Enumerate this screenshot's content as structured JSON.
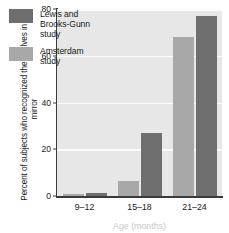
{
  "chart_data": {
    "type": "bar",
    "title": "",
    "xlabel": "Age (months)",
    "ylabel": "Percent of subjects who recognized themselves in a mirror",
    "categories": [
      "9–12",
      "15–18",
      "21–24"
    ],
    "series": [
      {
        "name": "Amsterdam study",
        "color": "#a8a8a8",
        "values": [
          1,
          6.5,
          68
        ]
      },
      {
        "name": "Lewis and Brooks-Gunn study",
        "color": "#6e6e6e",
        "values": [
          1.5,
          27,
          77
        ]
      }
    ],
    "ylim": [
      0,
      80
    ],
    "yticks": [
      0,
      20,
      40,
      60,
      80
    ],
    "ytick_labels": [
      "0",
      "20",
      "40",
      "60",
      "80"
    ],
    "grid": "horizontal",
    "legend_position": "upper-left-inside",
    "plot_background": "#e7e7e7",
    "axis_color": "#3a3a3a",
    "gridline_color": "#fbfbfb"
  },
  "legend": {
    "entries": [
      {
        "label": "Lewis and\nBrooks-Gunn\nstudy",
        "series": "Lewis and Brooks-Gunn study"
      },
      {
        "label": "Amsterdam\nstudy",
        "series": "Amsterdam study"
      }
    ]
  },
  "axes": {
    "y_title": "Percent of subjects who recognized themselves in a mirror",
    "x_title": "Age (months)"
  }
}
